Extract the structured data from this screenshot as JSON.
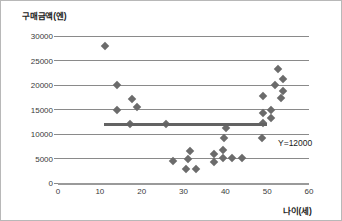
{
  "chart_data": {
    "type": "scatter",
    "title": "",
    "xlabel": "나이(세)",
    "ylabel": "구매금액(엔)",
    "xlim": [
      0,
      60
    ],
    "ylim": [
      0,
      30000
    ],
    "grid": true,
    "legend": "none",
    "xticks": [
      "0",
      "10",
      "20",
      "30",
      "40",
      "50",
      "60"
    ],
    "xtick_values": [
      0,
      10,
      20,
      30,
      40,
      50,
      60
    ],
    "yticks": [
      "0",
      "5000",
      "10000",
      "15000",
      "20000",
      "25000",
      "30000"
    ],
    "ytick_values": [
      0,
      5000,
      10000,
      15000,
      20000,
      25000,
      30000
    ],
    "marker_shape": "diamond",
    "marker_color": "#6b6b6b",
    "points": [
      {
        "x": 11.2,
        "y": 28000
      },
      {
        "x": 14.1,
        "y": 20000
      },
      {
        "x": 17.8,
        "y": 17200
      },
      {
        "x": 14.1,
        "y": 15000
      },
      {
        "x": 19.0,
        "y": 15600
      },
      {
        "x": 17.3,
        "y": 12000
      },
      {
        "x": 25.8,
        "y": 12000
      },
      {
        "x": 27.5,
        "y": 4500
      },
      {
        "x": 31.6,
        "y": 6600
      },
      {
        "x": 31.1,
        "y": 5000
      },
      {
        "x": 30.6,
        "y": 2900
      },
      {
        "x": 33.1,
        "y": 2800
      },
      {
        "x": 37.3,
        "y": 6000
      },
      {
        "x": 37.3,
        "y": 4200
      },
      {
        "x": 39.5,
        "y": 6800
      },
      {
        "x": 39.5,
        "y": 5100
      },
      {
        "x": 41.7,
        "y": 5100
      },
      {
        "x": 43.9,
        "y": 5100
      },
      {
        "x": 40.2,
        "y": 11300
      },
      {
        "x": 39.8,
        "y": 9100
      },
      {
        "x": 48.8,
        "y": 9100
      },
      {
        "x": 49.0,
        "y": 14300
      },
      {
        "x": 49.0,
        "y": 17700
      },
      {
        "x": 52.7,
        "y": 23200
      },
      {
        "x": 53.9,
        "y": 21200
      },
      {
        "x": 51.9,
        "y": 20000
      },
      {
        "x": 53.9,
        "y": 18800
      },
      {
        "x": 53.2,
        "y": 17300
      },
      {
        "x": 51.0,
        "y": 14800
      },
      {
        "x": 51.0,
        "y": 13300
      },
      {
        "x": 49.0,
        "y": 12200
      }
    ],
    "reference_line": {
      "label": "Y=12000",
      "value": 12000,
      "x_start": 11,
      "x_end": 50,
      "color": "#636363"
    }
  }
}
